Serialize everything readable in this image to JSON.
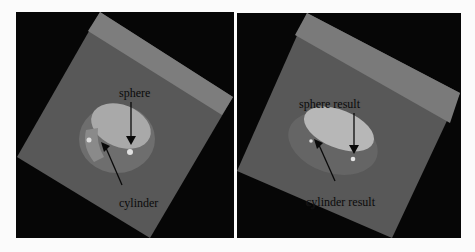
{
  "panels": [
    {
      "id": "left",
      "labels": {
        "top": "sphere",
        "bottom": "cylinder"
      }
    },
    {
      "id": "right",
      "labels": {
        "top": "sphere result",
        "bottom": "cylinder result"
      }
    }
  ],
  "colors": {
    "background": "#060606",
    "plate": "#585858",
    "plate_stripe": "#7a7a7a",
    "cavity_light": "#b8b8b8",
    "page": "#fbfbfb"
  }
}
